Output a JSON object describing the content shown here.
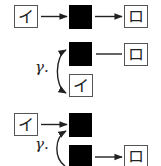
{
  "diagram": {
    "type": "glyph-transformation-diagram",
    "colors": {
      "node_fill": "#000000",
      "box_border": "#555555",
      "stroke": "#222222",
      "background": "#ffffff"
    },
    "rows": [
      {
        "id": "row1",
        "input_glyph": "イ",
        "output_glyph": "ロ",
        "edges": [
          "input -> black-node (arrow)",
          "black-node -> output (arrow)"
        ]
      },
      {
        "id": "row2",
        "label": "γ.",
        "top_glyph_output": "ロ",
        "bottom_glyph": "イ",
        "edges": [
          "black-node — output (line)",
          "black-node <-> bottom glyph (curved double arrow)"
        ]
      },
      {
        "id": "row3",
        "label": "γ.",
        "input_glyph": "イ",
        "output_glyph": "ロ",
        "edges": [
          "input -> top black-node (arrow)",
          "bottom black-node -> top black-node (curved arrow)",
          "bottom black-node -> output (arrow)"
        ]
      }
    ],
    "labels": {
      "row2_gamma": "γ.",
      "row3_gamma": "γ."
    },
    "glyphs": {
      "r1_in": "イ",
      "r1_out": "ロ",
      "r2_out": "ロ",
      "r2_bottom": "イ",
      "r3_in": "イ",
      "r3_out": "ロ"
    }
  }
}
